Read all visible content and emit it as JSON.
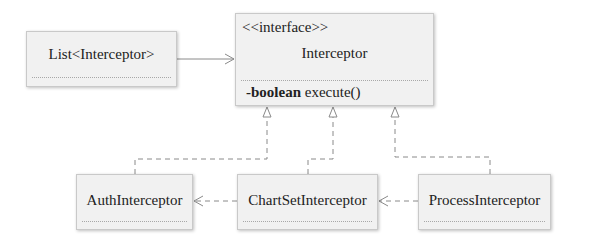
{
  "diagram": {
    "type": "uml-class",
    "classes": {
      "list": {
        "name": "List<Interceptor>"
      },
      "interface": {
        "stereotype": "<<interface>>",
        "name": "Interceptor",
        "operation_modifier": "-boolean",
        "operation_name": "execute()"
      },
      "auth": {
        "name": "AuthInterceptor"
      },
      "chartset": {
        "name": "ChartSetInterceptor"
      },
      "process": {
        "name": "ProcessInterceptor"
      }
    },
    "relations": [
      {
        "from": "List<Interceptor>",
        "to": "Interceptor",
        "kind": "association"
      },
      {
        "from": "AuthInterceptor",
        "to": "Interceptor",
        "kind": "realization"
      },
      {
        "from": "ChartSetInterceptor",
        "to": "Interceptor",
        "kind": "realization"
      },
      {
        "from": "ProcessInterceptor",
        "to": "Interceptor",
        "kind": "realization"
      },
      {
        "from": "ChartSetInterceptor",
        "to": "AuthInterceptor",
        "kind": "dependency"
      },
      {
        "from": "ProcessInterceptor",
        "to": "ChartSetInterceptor",
        "kind": "dependency"
      }
    ],
    "colors": {
      "line": "#8a8a8a",
      "box_fill": "#f1f1f1",
      "box_border": "#c9c9c9"
    }
  }
}
